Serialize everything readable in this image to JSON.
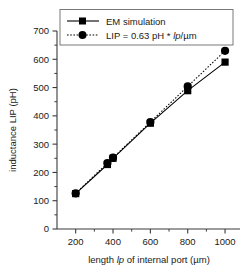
{
  "chart_data": {
    "type": "scatter",
    "title": "",
    "xlabel": "length lp of internal port (µm)",
    "ylabel": "inductance LIP (pH)",
    "xlim": [
      100,
      1080
    ],
    "ylim": [
      0,
      700
    ],
    "xticks": [
      200,
      400,
      600,
      800,
      1000
    ],
    "xtick_labels": [
      "200",
      "400",
      "600",
      "800",
      "1000"
    ],
    "x_minor_ticks": [
      300,
      500,
      700,
      900
    ],
    "yticks": [
      0,
      100,
      200,
      300,
      400,
      500,
      600,
      700
    ],
    "ytick_labels": [
      "0",
      "100",
      "200",
      "300",
      "400",
      "500",
      "600",
      "700"
    ],
    "y_minor_ticks": [
      50,
      150,
      250,
      350,
      450,
      550,
      650
    ],
    "grid": false,
    "legend_position": "top-center",
    "series": [
      {
        "name": "EM simulation",
        "marker": "square",
        "linestyle": "solid",
        "color": "#000000",
        "x": [
          200,
          370,
          400,
          600,
          800,
          1000
        ],
        "y": [
          125,
          228,
          250,
          374,
          489,
          590
        ]
      },
      {
        "name": "LIP = 0.63 pH * lp/µm",
        "marker": "circle",
        "linestyle": "dotted",
        "color": "#000000",
        "x": [
          200,
          370,
          400,
          600,
          800,
          1000
        ],
        "y": [
          126,
          233,
          252,
          378,
          504,
          630
        ]
      }
    ]
  },
  "axes": {
    "xlabel_prefix": "length ",
    "xlabel_italic": "lp",
    "xlabel_suffix": " of internal port (µm)",
    "ylabel": "inductance LIP (pH)"
  },
  "legend": {
    "entries": [
      {
        "label": "EM simulation",
        "marker": "square",
        "linestyle": "solid"
      },
      {
        "label_prefix": "LIP = 0.63 pH * ",
        "label_italic": "lp",
        "label_suffix": "/µm",
        "marker": "circle",
        "linestyle": "dotted"
      }
    ]
  },
  "style": {
    "line_color": "#000000",
    "axis_color": "#3a3a3a",
    "background": "#ffffff",
    "legend_border": "#6b6b6b"
  }
}
